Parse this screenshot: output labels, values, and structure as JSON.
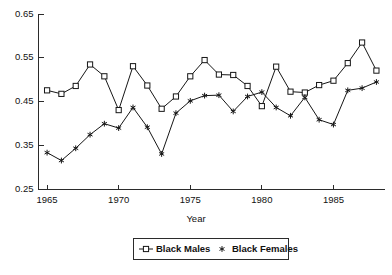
{
  "chart_data": {
    "type": "line",
    "title": "",
    "xlabel": "Year",
    "ylabel": "",
    "xlim": [
      1964.4,
      1988.6
    ],
    "ylim": [
      0.25,
      0.65
    ],
    "grid": false,
    "legend_position": "bottom-center",
    "x": [
      1965,
      1966,
      1967,
      1968,
      1969,
      1970,
      1971,
      1972,
      1973,
      1974,
      1975,
      1976,
      1977,
      1978,
      1979,
      1980,
      1981,
      1982,
      1983,
      1984,
      1985,
      1986,
      1987,
      1988
    ],
    "xticks": [
      1965,
      1970,
      1975,
      1980,
      1985
    ],
    "xtick_labels": [
      "1965",
      "1970",
      "1975",
      "1980",
      "1985"
    ],
    "yticks": [
      0.25,
      0.35,
      0.45,
      0.55,
      0.65
    ],
    "ytick_labels": [
      "0.25",
      "0.35",
      "0.45",
      "0.55",
      "0.65"
    ],
    "series": [
      {
        "name": "Black Males",
        "marker": "square",
        "values": [
          0.476,
          0.468,
          0.486,
          0.535,
          0.508,
          0.431,
          0.531,
          0.487,
          0.434,
          0.462,
          0.508,
          0.545,
          0.512,
          0.511,
          0.486,
          0.44,
          0.53,
          0.473,
          0.471,
          0.488,
          0.498,
          0.538,
          0.585,
          0.521
        ]
      },
      {
        "name": "Black Females",
        "marker": "star",
        "values": [
          0.334,
          0.316,
          0.344,
          0.375,
          0.4,
          0.39,
          0.437,
          0.392,
          0.331,
          0.424,
          0.452,
          0.464,
          0.465,
          0.428,
          0.462,
          0.472,
          0.437,
          0.418,
          0.46,
          0.409,
          0.398,
          0.476,
          0.481,
          0.495
        ]
      }
    ]
  },
  "legend": {
    "entries": [
      {
        "label": "Black Males",
        "marker": "square-marker"
      },
      {
        "label": "Black Females",
        "marker": "star-marker"
      }
    ]
  },
  "axis": {
    "x_title": "Year"
  }
}
